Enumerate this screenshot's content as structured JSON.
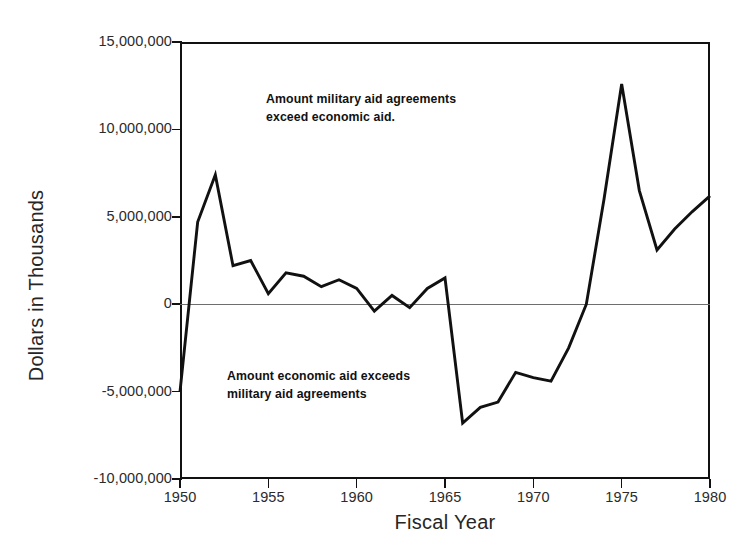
{
  "chart_data": {
    "type": "line",
    "title": "",
    "xlabel": "Fiscal Year",
    "ylabel": "Dollars in Thousands",
    "xlim": [
      1950,
      1980
    ],
    "ylim": [
      -10000000,
      15000000
    ],
    "grid": false,
    "legend": "none",
    "zero_reference_line": true,
    "x_tick_labels": [
      "1950",
      "1955",
      "1960",
      "1965",
      "1970",
      "1975",
      "1980"
    ],
    "x_ticks": [
      1950,
      1955,
      1960,
      1965,
      1970,
      1975,
      1980
    ],
    "y_tick_labels": [
      "15,000,000",
      "10,000,000",
      "5,000,000",
      "0",
      "-5,000,000",
      "-10,000,000"
    ],
    "y_ticks": [
      15000000,
      10000000,
      5000000,
      0,
      -5000000,
      -10000000
    ],
    "annotations": [
      {
        "id": "upper",
        "text": "Amount military aid agreements\nexceed economic aid.",
        "x": 1955,
        "y": 11400000
      },
      {
        "id": "lower",
        "text": "Amount economic aid exceeds\nmilitary aid agreements",
        "x": 1953,
        "y": -3800000
      }
    ],
    "x": [
      1950,
      1951,
      1952,
      1953,
      1954,
      1955,
      1956,
      1957,
      1958,
      1959,
      1960,
      1961,
      1962,
      1963,
      1964,
      1965,
      1966,
      1967,
      1968,
      1969,
      1970,
      1971,
      1972,
      1973,
      1974,
      1975,
      1976,
      1977,
      1978,
      1979,
      1980
    ],
    "values": [
      -5000000,
      4700000,
      7400000,
      2200000,
      2500000,
      600000,
      1800000,
      1600000,
      1000000,
      1400000,
      900000,
      -400000,
      500000,
      -200000,
      900000,
      1500000,
      -6800000,
      -5900000,
      -5600000,
      -3900000,
      -4200000,
      -4400000,
      -2500000,
      0,
      6000000,
      12600000,
      6500000,
      3100000,
      4300000,
      5300000,
      6200000
    ],
    "series": [
      {
        "name": "Military aid agreements minus economic aid",
        "color": "#111111",
        "values": [
          -5000000,
          4700000,
          7400000,
          2200000,
          2500000,
          600000,
          1800000,
          1600000,
          1000000,
          1400000,
          900000,
          -400000,
          500000,
          -200000,
          900000,
          1500000,
          -6800000,
          -5900000,
          -5600000,
          -3900000,
          -4200000,
          -4400000,
          -2500000,
          0,
          6000000,
          12600000,
          6500000,
          3100000,
          4300000,
          5300000,
          6200000
        ]
      }
    ]
  },
  "axes": {
    "y_title": "Dollars in Thousands",
    "x_title": "Fiscal Year",
    "y_labels": [
      "15,000,000",
      "10,000,000",
      "5,000,000",
      "0",
      "-5,000,000",
      "-10,000,000"
    ],
    "x_labels": [
      "1950",
      "1955",
      "1960",
      "1965",
      "1970",
      "1975",
      "1980"
    ]
  },
  "annotations": {
    "upper": "Amount military aid agreements\nexceed economic aid.",
    "lower": "Amount economic aid exceeds\nmilitary aid agreements"
  },
  "colors": {
    "line": "#111111",
    "frame": "#111111",
    "zero_line": "#6e6e6e",
    "text": "#262626",
    "background": "#ffffff"
  }
}
